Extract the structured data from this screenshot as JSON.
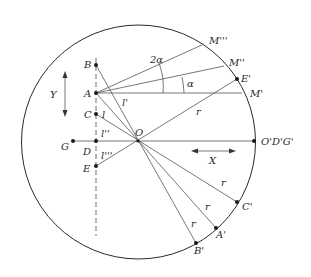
{
  "diagram": {
    "type": "geometric-construction",
    "circle": {
      "cx": 138.5,
      "cy": 142,
      "r": 117
    },
    "center": {
      "label": "O",
      "x": 138,
      "y": 141
    },
    "axis_points": [
      {
        "label": "B",
        "x": 96,
        "y": 65
      },
      {
        "label": "A",
        "x": 96,
        "y": 93
      },
      {
        "label": "C",
        "x": 96,
        "y": 114
      },
      {
        "label": "D",
        "x": 96,
        "y": 141
      },
      {
        "label": "E",
        "x": 96,
        "y": 166
      },
      {
        "label": "G",
        "x": 73,
        "y": 141
      }
    ],
    "circle_points": [
      {
        "label": "M'''",
        "x": 204,
        "y": 44
      },
      {
        "label": "M''",
        "x": 224,
        "y": 66
      },
      {
        "label": "E'",
        "x": 237,
        "y": 79
      },
      {
        "label": "M'",
        "x": 242,
        "y": 93
      },
      {
        "label": "O'D'G'",
        "x": 254,
        "y": 141
      },
      {
        "label": "C'",
        "x": 237,
        "y": 202
      },
      {
        "label": "A'",
        "x": 216,
        "y": 228
      },
      {
        "label": "B'",
        "x": 196,
        "y": 243
      }
    ],
    "segment_labels": {
      "l_prime": "l'",
      "l": "l",
      "l_double": "l''",
      "l_triple": "l'''",
      "r": "r"
    },
    "angle_labels": {
      "alpha": "α",
      "two_alpha": "2α"
    },
    "direction_labels": {
      "y_axis": "Y",
      "x_axis": "X"
    }
  }
}
